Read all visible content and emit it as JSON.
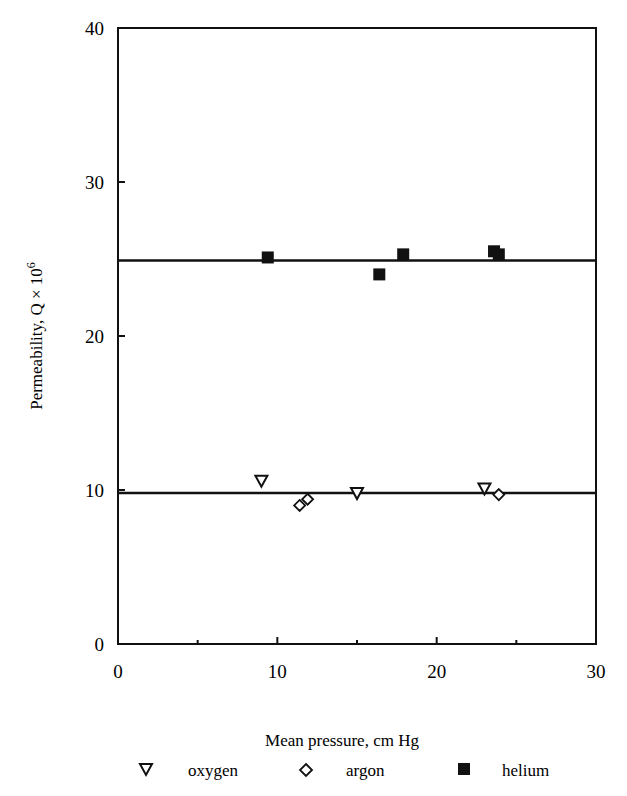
{
  "chart_data": {
    "type": "scatter",
    "title": "",
    "xlabel": "Mean pressure, cm Hg",
    "ylabel": "Permeability, Q × 10",
    "ylabel_superscript": "6",
    "xlim": [
      0,
      30
    ],
    "ylim": [
      0,
      40
    ],
    "x_ticks": [
      0,
      10,
      20,
      30
    ],
    "x_minor_ticks": [
      5,
      15,
      25
    ],
    "y_ticks": [
      0,
      10,
      20,
      30,
      40
    ],
    "grid": false,
    "legend_position": "bottom",
    "series": [
      {
        "name": "oxygen",
        "marker": "open-down-triangle",
        "points": [
          [
            9.0,
            10.6
          ],
          [
            15.0,
            9.8
          ],
          [
            23.0,
            10.1
          ]
        ]
      },
      {
        "name": "argon",
        "marker": "open-diamond",
        "points": [
          [
            11.4,
            9.0
          ],
          [
            11.9,
            9.4
          ],
          [
            23.9,
            9.7
          ]
        ]
      },
      {
        "name": "helium",
        "marker": "filled-square",
        "points": [
          [
            9.4,
            25.1
          ],
          [
            16.4,
            24.0
          ],
          [
            17.9,
            25.3
          ],
          [
            23.6,
            25.5
          ],
          [
            23.9,
            25.3
          ]
        ]
      }
    ],
    "reference_lines": [
      {
        "name": "helium-mean-line",
        "y": 24.9
      },
      {
        "name": "oxygen-argon-mean-line",
        "y": 9.8
      }
    ]
  },
  "legend": {
    "items": [
      {
        "label": "oxygen",
        "symbol": "▽"
      },
      {
        "label": "argon",
        "symbol": "◇"
      },
      {
        "label": "helium",
        "symbol": "■"
      }
    ]
  }
}
